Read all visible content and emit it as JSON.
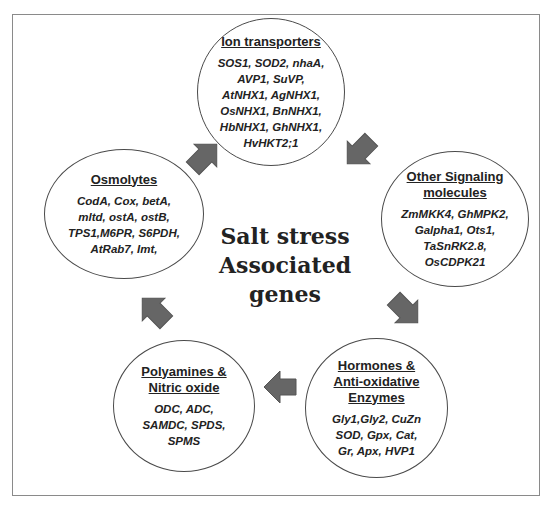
{
  "diagram": {
    "center_title": "Salt stress\nAssociated\ngenes",
    "nodes": [
      {
        "id": "ion-transporters",
        "title": "Ion transporters",
        "genes": "SOS1, SOD2, nhaA,\nAVP1, SuVP,\nAtNHX1, AgNHX1,\nOsNHX1, BnNHX1,\nHbNHX1, GhNHX1,\nHvHKT2;1"
      },
      {
        "id": "other-signaling-molecules",
        "title": "Other Signaling\nmolecules",
        "genes": "ZmMKK4, GhMPK2,\nGalpha1, Ots1,\nTaSnRK2.8,\nOsCDPK21"
      },
      {
        "id": "hormones-antioxidative-enzymes",
        "title": "Hormones &\nAnti-oxidative\nEnzymes",
        "genes": "Gly1,Gly2, CuZn\nSOD, Gpx, Cat,\nGr, Apx, HVP1"
      },
      {
        "id": "polyamines-nitric-oxide",
        "title": "Polyamines &\nNitric oxide",
        "genes": "ODC, ADC,\nSAMDC, SPDS,\nSPMS"
      },
      {
        "id": "osmolytes",
        "title": "Osmolytes",
        "genes": "CodA, Cox, betA,\nmltd, ostA, ostB,\nTPS1,M6PR, S6PDH,\nAtRab7, Imt,"
      }
    ],
    "arrows": [
      {
        "from": "ion-transporters",
        "to": "other-signaling-molecules",
        "direction": "down-right"
      },
      {
        "from": "other-signaling-molecules",
        "to": "hormones-antioxidative-enzymes",
        "direction": "down-left"
      },
      {
        "from": "hormones-antioxidative-enzymes",
        "to": "polyamines-nitric-oxide",
        "direction": "left"
      },
      {
        "from": "polyamines-nitric-oxide",
        "to": "osmolytes",
        "direction": "up-left"
      },
      {
        "from": "osmolytes",
        "to": "ion-transporters",
        "direction": "up-right"
      }
    ],
    "colors": {
      "arrow_fill": "#666666",
      "ellipse_stroke": "#4a4a4a",
      "frame_stroke": "#8a8a8a",
      "text": "#222222"
    }
  }
}
